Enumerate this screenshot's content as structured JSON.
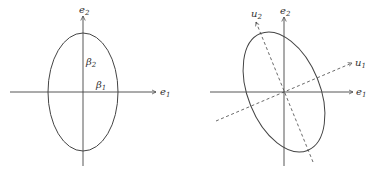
{
  "left_panel": {
    "axis_x_label": "e",
    "axis_x_sub": "1",
    "axis_y_label": "e",
    "axis_y_sub": "2",
    "beta1_label": "β",
    "beta1_sub": "1",
    "beta2_label": "β",
    "beta2_sub": "2"
  },
  "right_panel": {
    "axis_x_label": "e",
    "axis_x_sub": "1",
    "axis_y_label": "e",
    "axis_y_sub": "2",
    "u1_label": "u",
    "u1_sub": "1",
    "u2_label": "u",
    "u2_sub": "2"
  },
  "colors": {
    "stroke": "#444444",
    "text": "#333333"
  }
}
